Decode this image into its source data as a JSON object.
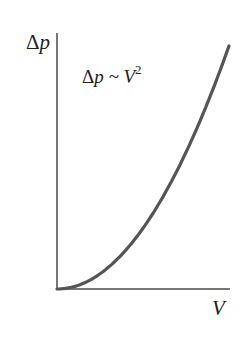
{
  "chart_data": {
    "type": "line",
    "title": "",
    "xlabel": "V",
    "ylabel": "Δp",
    "annotation": {
      "text": "Δp ~ V",
      "superscript": "2"
    },
    "grid": false,
    "legend": null,
    "x_ticks": [],
    "y_ticks": [],
    "series": [
      {
        "name": "Δp ~ V²",
        "relation": "quadratic",
        "x": [
          0,
          0.25,
          0.5,
          0.75,
          1.0
        ],
        "y": [
          0,
          0.0625,
          0.25,
          0.5625,
          1.0
        ]
      }
    ],
    "colors": {
      "curve": "#555555",
      "axes": "#777777"
    }
  },
  "labels": {
    "y_delta": "Δ",
    "y_var": "p",
    "x_var": "V",
    "anno_delta": "Δ",
    "anno_rest": "p ~ V",
    "anno_exp": "2"
  }
}
